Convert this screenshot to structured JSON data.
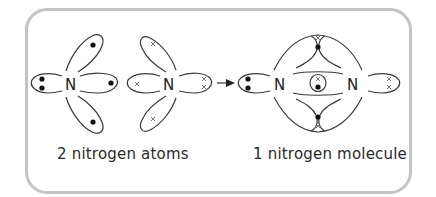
{
  "diagram": {
    "type": "dot-and-cross diagram",
    "reactants": {
      "caption": "2 nitrogen atoms",
      "atoms": [
        {
          "symbol": "N",
          "electron_marker": "dot",
          "electrons_shown": 5
        },
        {
          "symbol": "N",
          "electron_marker": "cross",
          "electrons_shown": 5
        }
      ]
    },
    "arrow": "→",
    "product": {
      "caption": "1 nitrogen molecule",
      "atoms": [
        {
          "symbol": "N"
        },
        {
          "symbol": "N"
        }
      ],
      "shared_pairs": 3,
      "lone_pairs": 2
    }
  },
  "labels": {
    "atom1_symbol": "N",
    "atom2_symbol": "N",
    "mol_left_symbol": "N",
    "mol_right_symbol": "N",
    "caption_left": "2 nitrogen atoms",
    "caption_right": "1 nitrogen molecule"
  },
  "colors": {
    "frame_border": "#c4c4c4",
    "line": "#3a3a3a",
    "dot": "#111111",
    "cross": "#6a6a6a",
    "background": "#ffffff"
  }
}
